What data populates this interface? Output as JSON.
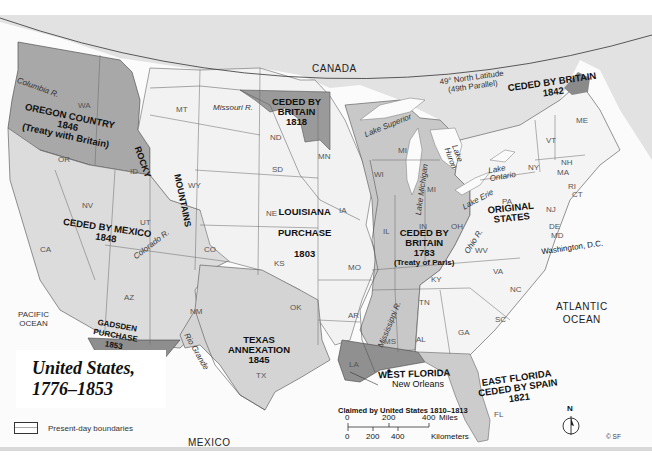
{
  "title": {
    "line1": "United States,",
    "line2": "1776–1853"
  },
  "legend": {
    "items": [
      {
        "symbol": "outline-box",
        "label": "Present-day boundaries"
      }
    ]
  },
  "scale_bar": {
    "miles_ticks": [
      "0",
      "200",
      "400"
    ],
    "miles_unit": "Miles",
    "km_ticks": [
      "0",
      "200",
      "400"
    ],
    "km_unit": "Kilometers"
  },
  "compass": {
    "label": "N"
  },
  "copyright": "© SF",
  "countries": {
    "canada": "CANADA",
    "mexico": "MEXICO"
  },
  "oceans": {
    "pacific": [
      "PACIFIC",
      "OCEAN"
    ],
    "atlantic": [
      "ATLANTIC",
      "OCEAN"
    ]
  },
  "parallel": {
    "line1": "49° North Latitude",
    "line2": "(49th Parallel)"
  },
  "regions": {
    "oregon": {
      "name": "OREGON COUNTRY",
      "year": "1846",
      "note": "(Treaty with Britain)"
    },
    "ceded_britain_1818": {
      "line1": "CEDED BY",
      "line2": "BRITAIN",
      "year": "1818"
    },
    "ceded_britain_1842": {
      "name": "CEDED BY BRITAIN",
      "year": "1842"
    },
    "louisiana": {
      "line1": "LOUISIANA",
      "line2": "PURCHASE",
      "year": "1803"
    },
    "ceded_mexico": {
      "name": "CEDED BY MEXICO",
      "year": "1848"
    },
    "ceded_britain_1783": {
      "line1": "CEDED BY",
      "line2": "BRITAIN",
      "year": "1783",
      "note": "(Treaty of Paris)"
    },
    "original_states": {
      "line1": "ORIGINAL",
      "line2": "STATES"
    },
    "gadsden": {
      "line1": "GADSDEN",
      "line2": "PURCHASE",
      "year": "1853"
    },
    "texas": {
      "line1": "TEXAS",
      "line2": "ANNEXATION",
      "year": "1845"
    },
    "west_florida": {
      "name": "WEST FLORIDA"
    },
    "claimed_1810": {
      "name": "Claimed by United States 1810–1813"
    },
    "east_florida": {
      "line1": "EAST FLORIDA",
      "line2": "CEDED BY SPAIN",
      "year": "1821"
    }
  },
  "mountains": {
    "line1": "ROCKY",
    "line2": "MOUNTAINS"
  },
  "rivers": {
    "columbia": "Columbia R.",
    "missouri": "Missouri R.",
    "colorado": "Colorado R.",
    "rio_grande": "Rio Grande",
    "mississippi": "Mississippi R.",
    "ohio": "Ohio R."
  },
  "lakes": {
    "superior": "Lake Superior",
    "michigan": "Lake Michigan",
    "huron": [
      "Lake",
      "Huron"
    ],
    "erie": "Lake Erie",
    "ontario": [
      "Lake",
      "Ontario"
    ]
  },
  "cities": {
    "new_orleans": "New Orleans",
    "washington": "Washington, D.C."
  },
  "states": {
    "WA": "WA",
    "OR": "OR",
    "ID": "ID",
    "MT": "MT",
    "WY": "WY",
    "NV": "NV",
    "UT": "UT",
    "CA": "CA",
    "CO": "CO",
    "AZ": "AZ",
    "NM": "NM",
    "ND": "ND",
    "SD": "SD",
    "NE": "NE",
    "KS": "KS",
    "OK": "OK",
    "TX": "TX",
    "MN": "MN",
    "IA": "IA",
    "MO": "MO",
    "AR": "AR",
    "LA": "LA",
    "WI": "WI",
    "MI_upper": "MI",
    "MI": "MI",
    "IL": "IL",
    "IN": "IN",
    "OH": "OH",
    "KY": "KY",
    "TN": "TN",
    "MS": "MS",
    "AL": "AL",
    "GA": "GA",
    "FL": "FL",
    "SC": "SC",
    "NC": "NC",
    "VA": "VA",
    "WV": "WV",
    "PA": "PA",
    "NY": "NY",
    "VT": "VT",
    "NH": "NH",
    "ME": "ME",
    "MA": "MA",
    "CT": "CT",
    "RI": "RI",
    "NJ": "NJ",
    "DE": "DE",
    "MD": "MD"
  },
  "colors": {
    "canada": "#e2e2e2",
    "original_states": "#f4f4f4",
    "louisiana": "#f2f2f2",
    "ceded_1783": "#c8c8c8",
    "ceded_mexico": "#dcdcdc",
    "oregon": "#a8a8a8",
    "ceded_1818": "#9a9a9a",
    "texas": "#d4d4d4",
    "gadsden": "#8e8e8e",
    "west_florida": "#909090",
    "east_florida": "#cccccc",
    "water": "#fbfbfb"
  }
}
